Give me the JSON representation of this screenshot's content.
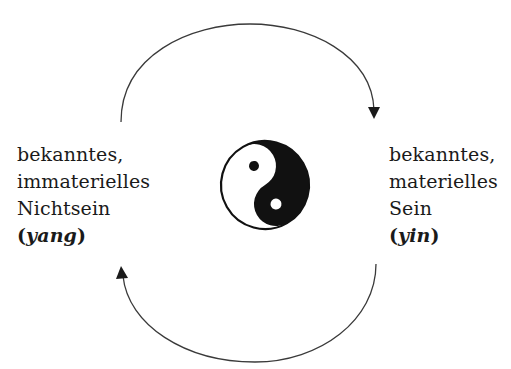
{
  "diagram": {
    "left": {
      "lines": [
        "bekanntes,",
        "immaterielles",
        "Nichtsein"
      ],
      "term_open": "(",
      "term": "yang",
      "term_close": ")"
    },
    "right": {
      "lines": [
        "bekanntes,",
        "materielles",
        "Sein"
      ],
      "term_open": "(",
      "term": "yin",
      "term_close": ")"
    },
    "center_symbol": "yin-yang",
    "arrows": [
      {
        "name": "top-arc",
        "from": "left",
        "to": "right",
        "direction": "clockwise"
      },
      {
        "name": "bottom-arc",
        "from": "right",
        "to": "left",
        "direction": "clockwise"
      }
    ],
    "colors": {
      "ink": "#1a1a1a",
      "arrow": "#3a3a3a",
      "background": "#ffffff"
    }
  }
}
